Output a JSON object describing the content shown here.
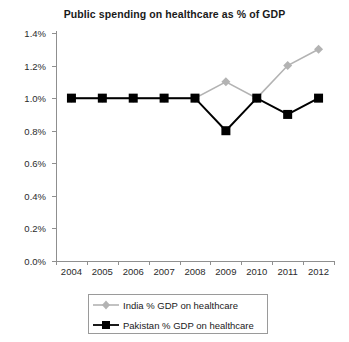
{
  "chart_data": {
    "type": "line",
    "title": "Public spending on healthcare as % of GDP",
    "xlabel": "",
    "ylabel": "",
    "categories": [
      "2004",
      "2005",
      "2006",
      "2007",
      "2008",
      "2009",
      "2010",
      "2011",
      "2012"
    ],
    "ylim": [
      0.0,
      1.4
    ],
    "ytick_values": [
      0.0,
      0.2,
      0.4,
      0.6,
      0.8,
      1.0,
      1.2,
      1.4
    ],
    "ytick_labels": [
      "0.0%",
      "0.2%",
      "0.4%",
      "0.6%",
      "0.8%",
      "1.0%",
      "1.2%",
      "1.4%"
    ],
    "grid": false,
    "legend_position": "bottom",
    "series": [
      {
        "name": "India % GDP on healthcare",
        "color": "#b3b3b3",
        "marker": "diamond",
        "values": [
          1.0,
          1.0,
          1.0,
          1.0,
          1.0,
          1.1,
          1.0,
          1.2,
          1.3
        ]
      },
      {
        "name": "Pakistan % GDP on healthcare",
        "color": "#000000",
        "marker": "square",
        "values": [
          1.0,
          1.0,
          1.0,
          1.0,
          1.0,
          0.8,
          1.0,
          0.9,
          1.0
        ]
      }
    ]
  },
  "legend": {
    "items": [
      {
        "label": "India % GDP on healthcare"
      },
      {
        "label": "Pakistan % GDP on healthcare"
      }
    ]
  },
  "colors": {
    "india": "#b3b3b3",
    "pakistan": "#000000",
    "axis": "#8f8f8f",
    "text": "#1a1a1a",
    "background": "#ffffff"
  }
}
